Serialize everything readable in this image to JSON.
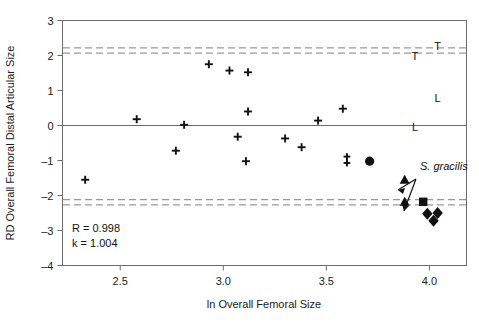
{
  "chart_data": {
    "type": "scatter",
    "title": "",
    "xlabel": "ln Overall Femoral Size",
    "ylabel": "RD Overall Femoral Distal Articular Size",
    "xlim": [
      2.22,
      4.18
    ],
    "ylim": [
      -4,
      3
    ],
    "xticks": [
      2.5,
      3.0,
      3.5,
      4.0
    ],
    "xtick_labels": [
      "2.5",
      "3.0",
      "3.5",
      "4.0"
    ],
    "yticks": [
      -4,
      -3,
      -2,
      -1,
      0,
      1,
      2,
      3
    ],
    "ytick_labels": [
      "-4",
      "-3",
      "-2",
      "-1",
      "0",
      "1",
      "2",
      "3"
    ],
    "grid": false,
    "legend": "none",
    "zero_line": 0,
    "reference_lines": [
      {
        "name": "upper-outer",
        "y": 2.22,
        "style": "dashed"
      },
      {
        "name": "upper-inner",
        "y": 2.07,
        "style": "dashed"
      },
      {
        "name": "lower-inner",
        "y": -2.12,
        "style": "dashed"
      },
      {
        "name": "lower-outer",
        "y": -2.27,
        "style": "dashed"
      }
    ],
    "series": [
      {
        "name": "comparative sample",
        "marker": "plus",
        "points": [
          {
            "x": 2.33,
            "y": -1.55
          },
          {
            "x": 2.58,
            "y": 0.18
          },
          {
            "x": 2.77,
            "y": -0.72
          },
          {
            "x": 2.81,
            "y": 0.02
          },
          {
            "x": 2.93,
            "y": 1.75
          },
          {
            "x": 3.03,
            "y": 1.57
          },
          {
            "x": 3.07,
            "y": -0.32
          },
          {
            "x": 3.12,
            "y": 1.52
          },
          {
            "x": 3.12,
            "y": 0.4
          },
          {
            "x": 3.11,
            "y": -1.02
          },
          {
            "x": 3.3,
            "y": -0.37
          },
          {
            "x": 3.38,
            "y": -0.62
          },
          {
            "x": 3.46,
            "y": 0.14
          },
          {
            "x": 3.58,
            "y": 0.48
          }
        ]
      },
      {
        "name": "double-dagger specimen",
        "marker": "double-plus",
        "points": [
          {
            "x": 3.6,
            "y": -0.98
          }
        ]
      },
      {
        "name": "filled circle specimen",
        "marker": "circle",
        "points": [
          {
            "x": 3.71,
            "y": -1.02
          }
        ]
      },
      {
        "name": "S. gracilis",
        "marker": "triangle",
        "points": [
          {
            "x": 3.88,
            "y": -1.55
          },
          {
            "x": 3.88,
            "y": -2.18
          }
        ]
      },
      {
        "name": "square specimen",
        "marker": "square",
        "points": [
          {
            "x": 3.97,
            "y": -2.18
          }
        ]
      },
      {
        "name": "diamond specimens",
        "marker": "diamond",
        "points": [
          {
            "x": 3.99,
            "y": -2.52
          },
          {
            "x": 4.04,
            "y": -2.5
          },
          {
            "x": 4.02,
            "y": -2.72
          }
        ]
      },
      {
        "name": "T group",
        "marker": "letter-T",
        "points": [
          {
            "x": 4.04,
            "y": 2.28
          },
          {
            "x": 3.93,
            "y": 1.98
          }
        ]
      },
      {
        "name": "L group",
        "marker": "letter-L",
        "points": [
          {
            "x": 4.04,
            "y": 0.8
          },
          {
            "x": 3.93,
            "y": -0.05
          }
        ]
      }
    ],
    "annotations": [
      {
        "name": "correlation",
        "text": "R = 0.998"
      },
      {
        "name": "slope",
        "text": "k = 1.004"
      },
      {
        "name": "species-label",
        "text": "S. gracilis"
      }
    ]
  },
  "stats": {
    "r_label": "R = 0.998",
    "k_label": "k = 1.004"
  },
  "species": {
    "label": "S. gracilis"
  },
  "group_letters": {
    "t1": "T",
    "t2": "T",
    "l1": "L",
    "l2": "L"
  },
  "colors": {
    "axis": "#555555",
    "marker": "#111111",
    "dashed": "#999999",
    "background": "#ffffff"
  }
}
